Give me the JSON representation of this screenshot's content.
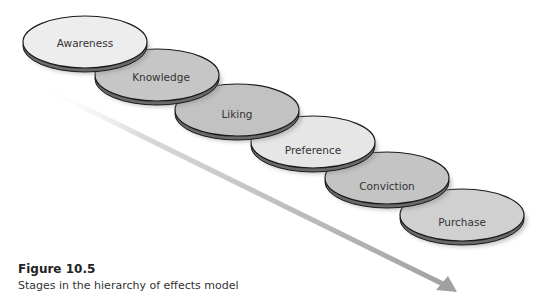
{
  "figure": {
    "number_label": "Figure 10.5",
    "caption": "Stages in the hierarchy of effects model"
  },
  "stages": [
    {
      "label": "Awareness",
      "fill": "#ededed"
    },
    {
      "label": "Knowledge",
      "fill": "#c6c6c6"
    },
    {
      "label": "Liking",
      "fill": "#c2c2c2"
    },
    {
      "label": "Preference",
      "fill": "#e6e6e6"
    },
    {
      "label": "Conviction",
      "fill": "#c4c4c4"
    },
    {
      "label": "Purchase",
      "fill": "#d0d0d0"
    }
  ],
  "colors": {
    "arrow": "#a8a8a8",
    "outline": "#1a1a1a",
    "shadow": "#999999"
  },
  "icons": {
    "arrow": "diagonal-down-right-arrow"
  }
}
